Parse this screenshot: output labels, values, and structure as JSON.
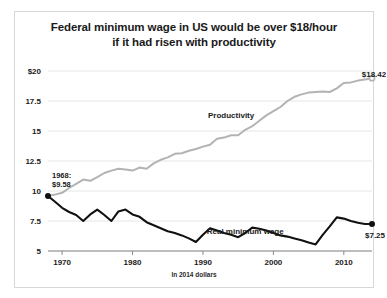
{
  "chart": {
    "title_line1": "Federal minimum wage in US would be over $18/hour",
    "title_line2": "if it had risen with productivity",
    "footnote": "In 2014 dollars"
  },
  "chart_data": {
    "type": "line",
    "title": "Federal minimum wage in US would be over $18/hour if it had risen with productivity",
    "xlabel": "",
    "ylabel": "",
    "footnote": "In 2014 dollars",
    "grid": true,
    "legend": "inline-annotations",
    "xlim": [
      1968,
      2014
    ],
    "ylim": [
      5,
      20
    ],
    "xticks": [
      1970,
      1980,
      1990,
      2000,
      2010
    ],
    "xtick_labels": [
      "1970",
      "1980",
      "1990",
      "2000",
      "2010"
    ],
    "yticks": [
      5,
      7.5,
      10,
      12.5,
      15,
      17.5,
      20
    ],
    "ytick_labels": [
      "5",
      "7.5",
      "10",
      "12.5",
      "15",
      "17.5",
      "$20"
    ],
    "annotations": [
      {
        "name": "start-annotation",
        "text_line1": "1968:",
        "text_line2": "$9.58",
        "x": 1968,
        "y": 9.58
      },
      {
        "name": "productivity-end-label",
        "text": "$18.42",
        "x": 2014,
        "y": 18.42
      },
      {
        "name": "wage-end-label",
        "text": "$7.25",
        "x": 2014,
        "y": 7.25
      }
    ],
    "series": [
      {
        "name": "Productivity",
        "color": "#b3b3b3",
        "label_x": 1994,
        "label_y": 16.1,
        "end_marker": true,
        "x": [
          1968,
          1969,
          1970,
          1971,
          1972,
          1973,
          1974,
          1975,
          1976,
          1977,
          1978,
          1979,
          1980,
          1981,
          1982,
          1983,
          1984,
          1985,
          1986,
          1987,
          1988,
          1989,
          1990,
          1991,
          1992,
          1993,
          1994,
          1995,
          1996,
          1997,
          1998,
          1999,
          2000,
          2001,
          2002,
          2003,
          2004,
          2005,
          2006,
          2007,
          2008,
          2009,
          2010,
          2011,
          2012,
          2013,
          2014
        ],
        "y": [
          9.58,
          9.7,
          9.85,
          10.25,
          10.6,
          10.95,
          10.85,
          11.15,
          11.5,
          11.7,
          11.85,
          11.8,
          11.7,
          11.95,
          11.85,
          12.3,
          12.6,
          12.8,
          13.1,
          13.15,
          13.35,
          13.5,
          13.7,
          13.85,
          14.35,
          14.45,
          14.65,
          14.65,
          15.1,
          15.4,
          15.85,
          16.3,
          16.65,
          17.0,
          17.5,
          17.85,
          18.05,
          18.2,
          18.25,
          18.3,
          18.25,
          18.55,
          19.0,
          19.05,
          19.2,
          19.3,
          19.4
        ]
      },
      {
        "name": "Real minimum wage",
        "color": "#111111",
        "label_x": 1996,
        "label_y": 6.45,
        "start_marker": true,
        "end_marker": true,
        "x": [
          1968,
          1969,
          1970,
          1971,
          1972,
          1973,
          1974,
          1975,
          1976,
          1977,
          1978,
          1979,
          1980,
          1981,
          1982,
          1983,
          1984,
          1985,
          1986,
          1987,
          1988,
          1989,
          1990,
          1991,
          1992,
          1993,
          1994,
          1995,
          1996,
          1997,
          1998,
          1999,
          2000,
          2001,
          2002,
          2003,
          2004,
          2005,
          2006,
          2007,
          2008,
          2009,
          2010,
          2011,
          2012,
          2013,
          2014
        ],
        "y": [
          9.58,
          9.1,
          8.6,
          8.25,
          8.0,
          7.5,
          8.05,
          8.45,
          8.0,
          7.5,
          8.3,
          8.45,
          8.05,
          7.85,
          7.4,
          7.15,
          6.9,
          6.65,
          6.5,
          6.3,
          6.05,
          5.75,
          6.35,
          6.9,
          6.7,
          6.5,
          6.35,
          6.15,
          6.5,
          6.95,
          6.85,
          6.7,
          6.5,
          6.3,
          6.2,
          6.05,
          5.9,
          5.7,
          5.55,
          6.35,
          7.05,
          7.8,
          7.7,
          7.5,
          7.35,
          7.25,
          7.25
        ]
      }
    ]
  }
}
